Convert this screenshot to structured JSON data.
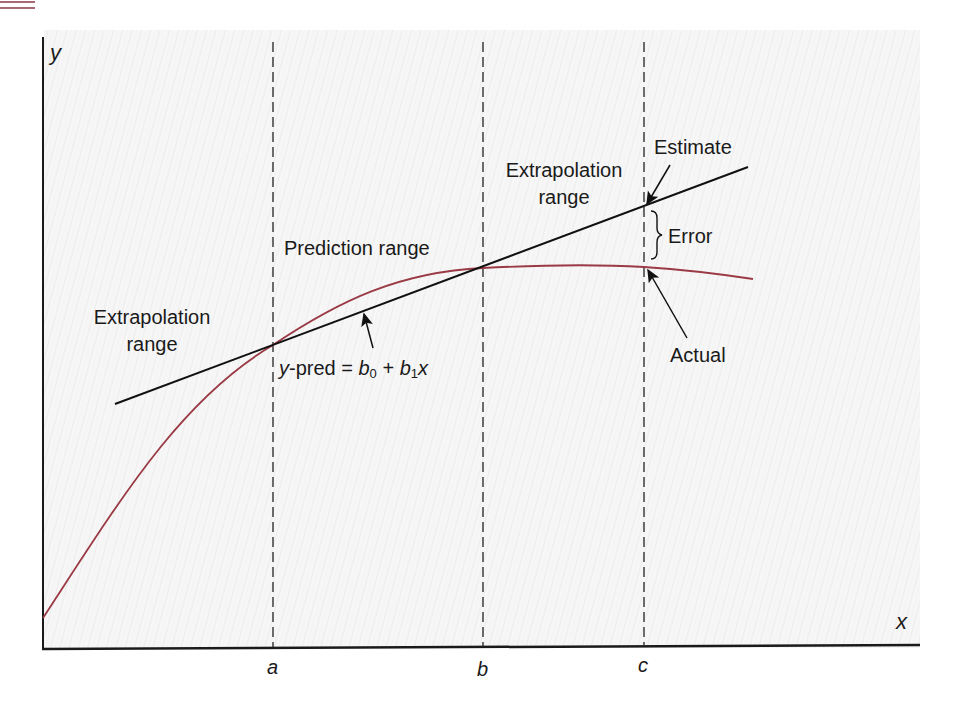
{
  "figure": {
    "axes": {
      "x_label": "x",
      "y_label": "y"
    },
    "boundaries": [
      {
        "id": "a",
        "label": "a"
      },
      {
        "id": "b",
        "label": "b"
      },
      {
        "id": "c",
        "label": "c"
      }
    ],
    "regions": {
      "left_extrapolation": {
        "line1": "Extrapolation",
        "line2": "range"
      },
      "prediction": {
        "label": "Prediction range"
      },
      "right_extrapolation": {
        "line1": "Extrapolation",
        "line2": "range"
      }
    },
    "annotations": {
      "estimate": "Estimate",
      "error": "Error",
      "actual": "Actual",
      "equation": {
        "lhs": "y",
        "pred": "-pred = ",
        "b0": "b",
        "sub0": "0",
        "plus": " + ",
        "b1": "b",
        "sub1": "1",
        "x": "x"
      }
    },
    "series": [
      {
        "name": "actual-curve",
        "color": "#9a3a44",
        "type": "curve"
      },
      {
        "name": "regression-line",
        "color": "#111111",
        "type": "line"
      }
    ]
  }
}
